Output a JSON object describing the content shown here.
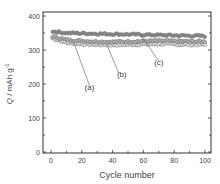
{
  "chart_data": {
    "type": "scatter",
    "title": "",
    "xlabel": "Cycle number",
    "ylabel": "Q / mAh g⁻¹",
    "xlim": [
      0,
      100
    ],
    "ylim": [
      0,
      400
    ],
    "xticks": [
      0,
      20,
      40,
      60,
      80,
      100
    ],
    "yticks": [
      0,
      100,
      200,
      300,
      400
    ],
    "grid": false,
    "legend_position": "none",
    "annotations": [
      {
        "label": "(a)",
        "points_to_cycle": 15,
        "points_to_value": 322
      },
      {
        "label": "(b)",
        "points_to_cycle": 35,
        "points_to_value": 318
      },
      {
        "label": "(c)",
        "points_to_cycle": 55,
        "points_to_value": 345
      }
    ],
    "x": [
      1,
      10,
      20,
      30,
      40,
      50,
      60,
      70,
      80,
      90,
      100
    ],
    "series": [
      {
        "name": "(a)",
        "values": [
          335,
          322,
          318,
          316,
          315,
          316,
          317,
          318,
          317,
          316,
          316
        ]
      },
      {
        "name": "(b)",
        "values": [
          340,
          330,
          327,
          325,
          324,
          325,
          326,
          327,
          326,
          325,
          325
        ]
      },
      {
        "name": "(c)",
        "values": [
          355,
          350,
          349,
          348,
          347,
          346,
          345,
          344,
          343,
          342,
          341
        ]
      }
    ]
  },
  "axes": {
    "x_label": "Cycle number",
    "y_label_q": "Q",
    "y_label_unit": " / mAh g",
    "y_label_sup": "-1",
    "x_ticks": [
      "0",
      "20",
      "40",
      "60",
      "80",
      "100"
    ],
    "y_ticks": [
      "0",
      "100",
      "200",
      "300",
      "400"
    ]
  },
  "annotations": {
    "a": "(a)",
    "b": "(b)",
    "c": "(c)"
  }
}
